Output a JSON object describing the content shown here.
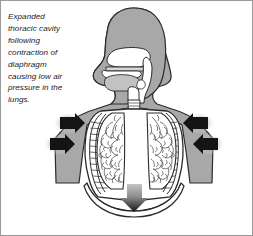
{
  "figure": {
    "caption": "Expanded\nthoracic cavity\nfollowing\ncontraction of\ndiaphragm\ncausing low air\npressure in the\nlungs.",
    "caption_lines": [
      "Expanded",
      "thoracic cavity",
      "following",
      "contraction of",
      "diaphragm",
      "causing low air",
      "pressure in the",
      "lungs."
    ]
  },
  "colors": {
    "background": "#ffffff",
    "border": "#9a9a9a",
    "body_fill": "#a8a8a8",
    "body_outline": "#2b2b2b",
    "cavity_fill": "#ffffff",
    "airway_fill": "#ffffff",
    "lung_fill": "#ffffff",
    "bronchi_stroke": "#4a4a4a",
    "arrow_fill": "#141414",
    "arrow_shadow": "#b9b9b9",
    "text": "#1a1a1a",
    "midtone": "#c9c9c9"
  },
  "anatomy": {
    "parts": [
      {
        "name": "head",
        "label": "Head"
      },
      {
        "name": "nasal-cavity",
        "label": "Nasal cavity"
      },
      {
        "name": "hard-palate",
        "label": "Hard palate"
      },
      {
        "name": "tongue",
        "label": "Tongue"
      },
      {
        "name": "oral-cavity",
        "label": "Oral cavity"
      },
      {
        "name": "pharynx",
        "label": "Pharynx"
      },
      {
        "name": "epiglottis",
        "label": "Epiglottis"
      },
      {
        "name": "larynx",
        "label": "Larynx"
      },
      {
        "name": "trachea",
        "label": "Trachea"
      },
      {
        "name": "left-bronchus",
        "label": "Left bronchus"
      },
      {
        "name": "right-bronchus",
        "label": "Right bronchus"
      },
      {
        "name": "left-lung",
        "label": "Left lung"
      },
      {
        "name": "right-lung",
        "label": "Right lung"
      },
      {
        "name": "ribcage",
        "label": "Rib cage"
      },
      {
        "name": "diaphragm",
        "label": "Diaphragm"
      },
      {
        "name": "torso",
        "label": "Torso"
      }
    ]
  },
  "arrows": {
    "chest": [
      {
        "name": "arrow-chest-left-upper",
        "direction": "right",
        "label": "Chest wall moves outward (left upper)"
      },
      {
        "name": "arrow-chest-left-lower",
        "direction": "right",
        "label": "Chest wall moves outward (left lower)"
      },
      {
        "name": "arrow-chest-right-upper",
        "direction": "left",
        "label": "Chest wall moves outward (right upper)"
      },
      {
        "name": "arrow-chest-right-lower",
        "direction": "left",
        "label": "Chest wall moves outward (right lower)"
      }
    ],
    "diaphragm": {
      "name": "arrow-diaphragm-down",
      "direction": "down",
      "label": "Diaphragm contracts and moves down"
    }
  }
}
